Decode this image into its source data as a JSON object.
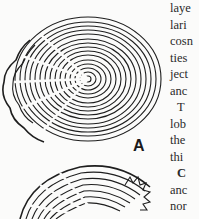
{
  "figure": {
    "labels": [
      "A"
    ]
  },
  "text_column": {
    "lines": [
      {
        "text": "laye",
        "indent": false,
        "bold": false
      },
      {
        "text": "lari",
        "indent": false,
        "bold": false
      },
      {
        "text": "cosn",
        "indent": false,
        "bold": false
      },
      {
        "text": "ties",
        "indent": false,
        "bold": false
      },
      {
        "text": "ject",
        "indent": false,
        "bold": false
      },
      {
        "text": "anc",
        "indent": false,
        "bold": false
      },
      {
        "text": "T",
        "indent": true,
        "bold": false
      },
      {
        "text": "lob",
        "indent": false,
        "bold": false
      },
      {
        "text": "the",
        "indent": false,
        "bold": false
      },
      {
        "text": "thi",
        "indent": false,
        "bold": false
      },
      {
        "text": "C",
        "indent": true,
        "bold": true
      },
      {
        "text": "anc",
        "indent": false,
        "bold": false
      },
      {
        "text": "nor",
        "indent": false,
        "bold": false
      }
    ]
  }
}
